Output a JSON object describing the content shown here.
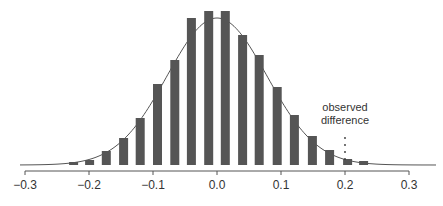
{
  "chart_data": {
    "type": "bar",
    "title": "",
    "xlabel": "",
    "ylabel": "",
    "xlim": [
      -0.3,
      0.3
    ],
    "grid": false,
    "legend": null,
    "x_ticks": [
      -0.3,
      -0.2,
      -0.1,
      0.0,
      0.1,
      0.2,
      0.3
    ],
    "x_tick_labels": [
      "−0.3",
      "−0.2",
      "−0.1",
      "0.0",
      "0.1",
      "0.2",
      "0.3"
    ],
    "bar_centers": [
      -0.224,
      -0.199,
      -0.173,
      -0.146,
      -0.12,
      -0.093,
      -0.066,
      -0.04,
      -0.013,
      0.013,
      0.04,
      0.066,
      0.094,
      0.121,
      0.149,
      0.176,
      0.204,
      0.229
    ],
    "relative_heights": [
      3,
      5,
      14,
      27,
      47,
      81,
      105,
      147,
      154,
      154,
      130,
      110,
      78,
      50,
      29,
      15,
      6,
      4
    ],
    "overlay_curve": {
      "type": "normal",
      "mean": 0.0,
      "sd_approx": 0.078,
      "peak_relative_height": 147
    },
    "annotation": {
      "text_line1": "observed",
      "text_line2": "difference",
      "x": 0.2,
      "style": "dotted vertical line"
    },
    "bar_color": "#555555",
    "curve_color": "#555555"
  }
}
